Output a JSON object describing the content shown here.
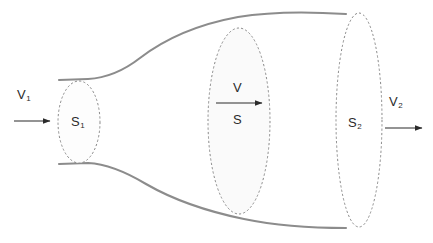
{
  "diagram": {
    "background_color": "#ffffff",
    "tube_outline_color": "#8c8c8c",
    "cross_section_outline_color": "#8a8a8a",
    "cross_section_fill_color": "#fafafa",
    "arrow_color": "#2b2b2b",
    "label_color": "#2b2b2b"
  },
  "labels": {
    "inlet_velocity": {
      "base": "V",
      "sub": "1"
    },
    "inlet_area": {
      "base": "S",
      "sub": "1"
    },
    "mid_velocity": {
      "base": "V",
      "sub": ""
    },
    "mid_area": {
      "base": "S",
      "sub": ""
    },
    "outlet_area": {
      "base": "S",
      "sub": "2"
    },
    "outlet_velocity": {
      "base": "V",
      "sub": "2"
    }
  },
  "cross_sections": [
    {
      "name": "S1",
      "cx": 79,
      "cy": 122,
      "rx": 21,
      "ry": 41
    },
    {
      "name": "S",
      "cx": 239,
      "cy": 121,
      "rx": 31,
      "ry": 93
    },
    {
      "name": "S2",
      "cx": 359,
      "cy": 120,
      "rx": 23,
      "ry": 107
    }
  ],
  "arrows": [
    {
      "name": "inlet-flow-arrow",
      "x1": 14,
      "y1": 121,
      "x2": 50,
      "y2": 121
    },
    {
      "name": "mid-flow-arrow",
      "x1": 216,
      "y1": 103,
      "x2": 262,
      "y2": 103
    },
    {
      "name": "outlet-flow-arrow",
      "x1": 385,
      "y1": 128,
      "x2": 422,
      "y2": 128
    }
  ]
}
